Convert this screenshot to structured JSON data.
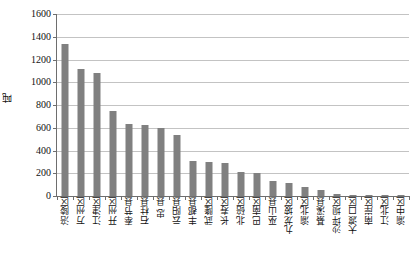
{
  "chart_data": {
    "type": "bar",
    "title": "",
    "subtitle": "",
    "xlabel": "",
    "ylabel": "吨",
    "ylim": [
      0,
      1600
    ],
    "ytick_step": 200,
    "yticks": [
      1600,
      1400,
      1200,
      1000,
      800,
      600,
      400,
      200,
      0
    ],
    "ytick_labels": [
      "1600",
      "1400",
      "1200",
      "1000",
      "800",
      "600",
      "400",
      "200",
      "0"
    ],
    "grid": true,
    "grid_axis": "y",
    "legend": false,
    "legend_position": "none",
    "bar_color": "#808080",
    "gridline_color": "#c3c3c3",
    "axis_color": "#6e6e6e",
    "categories": [
      "涪陵区",
      "万州区",
      "江津区",
      "开州区",
      "奉节县",
      "石柱县",
      "忠  县",
      "云阳县",
      "丰都县",
      "武隆区",
      "长寿区",
      "北碚区",
      "巴南区",
      "巫山县",
      "九龙坡区",
      "渝北区",
      "綦溪县",
      "沙坪坝区",
      "大渡口区",
      "南岸区",
      "江北区",
      "渝中区"
    ],
    "values": [
      1335,
      1120,
      1085,
      745,
      630,
      620,
      595,
      540,
      305,
      300,
      290,
      215,
      205,
      130,
      118,
      80,
      55,
      15,
      4,
      3,
      2,
      1
    ]
  }
}
